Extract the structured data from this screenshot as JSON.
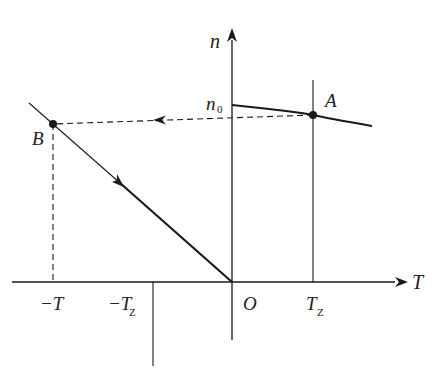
{
  "diagram": {
    "axes": {
      "x_label": "T",
      "y_label": "n",
      "origin_label": "O"
    },
    "x_ticks": [
      {
        "main": "−T",
        "sub": ""
      },
      {
        "main": "−T",
        "sub": "Z"
      },
      {
        "main": "T",
        "sub": "Z"
      }
    ],
    "y_ticks": [
      {
        "main": "n",
        "sub": "0"
      }
    ],
    "points": [
      {
        "label": "A"
      },
      {
        "label": "B"
      }
    ],
    "colors": {
      "line": "#1a1a1a",
      "background": "#ffffff"
    }
  }
}
